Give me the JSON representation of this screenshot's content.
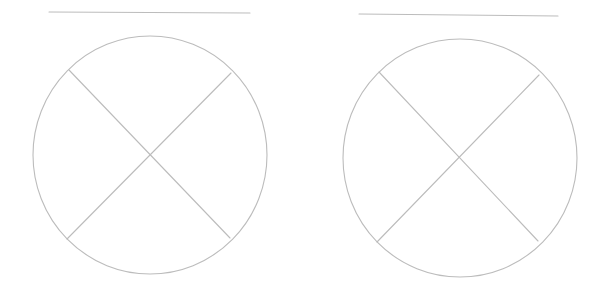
{
  "canvas": {
    "width": 601,
    "height": 289,
    "background": "#ffffff"
  },
  "style": {
    "stroke_color": "#bcbcbc",
    "stroke_width": 1.1
  },
  "figures": [
    {
      "name": "crossed-circle-left",
      "top_line": {
        "x1": 49,
        "y1": 12,
        "x2": 250,
        "y2": 13
      },
      "circle": {
        "cx": 150,
        "cy": 155,
        "rx": 117,
        "ry": 119
      },
      "cross": [
        {
          "x1": 69,
          "y1": 70,
          "x2": 230,
          "y2": 238
        },
        {
          "x1": 231,
          "y1": 73,
          "x2": 67,
          "y2": 239
        }
      ]
    },
    {
      "name": "crossed-circle-right",
      "top_line": {
        "x1": 359,
        "y1": 14,
        "x2": 558,
        "y2": 16
      },
      "circle": {
        "cx": 460,
        "cy": 158,
        "rx": 117,
        "ry": 119
      },
      "cross": [
        {
          "x1": 379,
          "y1": 72,
          "x2": 538,
          "y2": 241
        },
        {
          "x1": 539,
          "y1": 75,
          "x2": 377,
          "y2": 242
        }
      ]
    }
  ]
}
